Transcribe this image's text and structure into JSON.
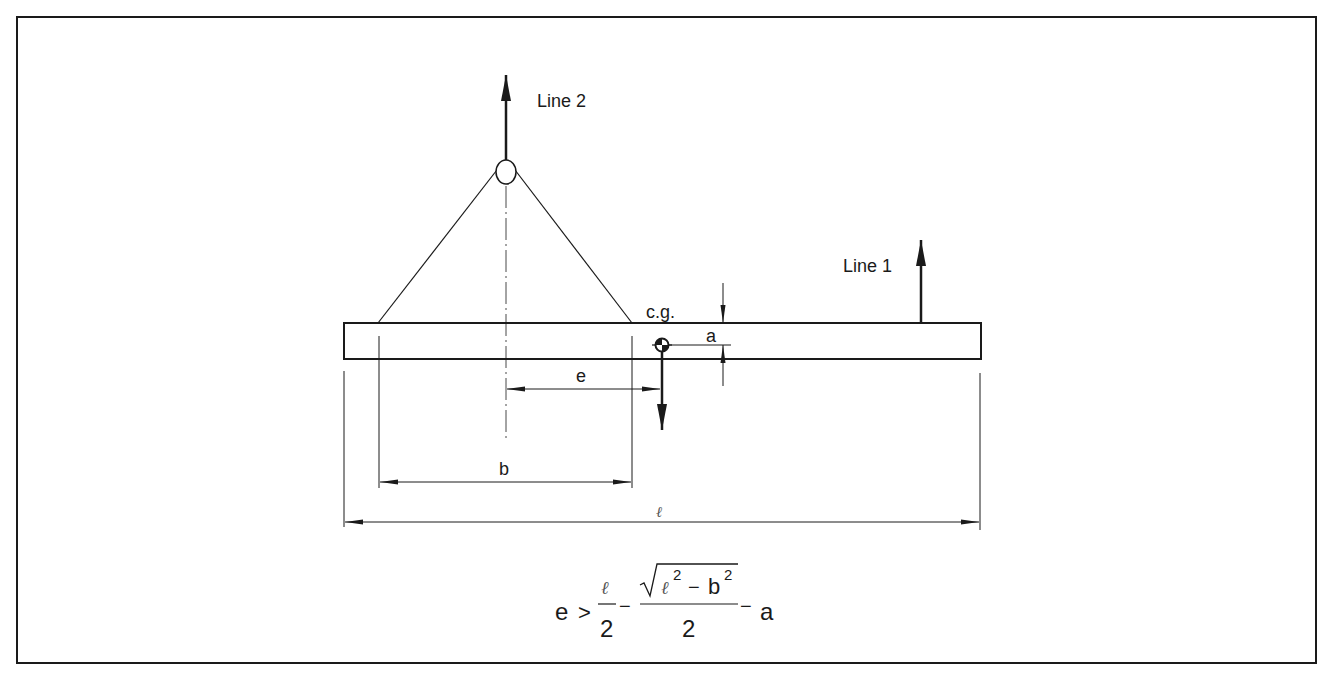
{
  "figure": {
    "frame_color": "#1a1a1a",
    "line_color": "#1a1a1a",
    "background": "#ffffff"
  },
  "labels": {
    "line2": "Line 2",
    "line1": "Line 1",
    "cg": "c.g.",
    "dim_a": "a",
    "dim_e": "e",
    "dim_b": "b",
    "dim_length": "ℓ"
  },
  "formula": {
    "lhs": "e",
    "relation": ">",
    "term1_numerator": "ℓ",
    "term1_denominator": "2",
    "minus1": "−",
    "term2_radicand_a": "ℓ",
    "term2_exp_a": "2",
    "term2_minus": "−",
    "term2_radicand_b": "b",
    "term2_exp_b": "2",
    "term2_denominator": "2",
    "minus2": "−",
    "tail": "a"
  }
}
